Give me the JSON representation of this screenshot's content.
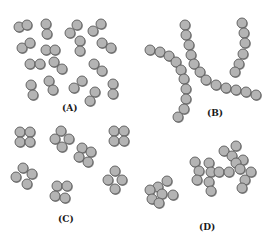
{
  "figure": {
    "panels": [
      {
        "id": "A",
        "label": "(A)",
        "arrangement": "diplococci"
      },
      {
        "id": "B",
        "label": "(B)",
        "arrangement": "streptococci"
      },
      {
        "id": "C",
        "label": "(C)",
        "arrangement": "tetrads"
      },
      {
        "id": "D",
        "label": "(D)",
        "arrangement": "staphylococci"
      }
    ],
    "colors": {
      "cell_fill": "#b4b4b4",
      "cell_outline": "#5a5a5a",
      "background": "#ffffff"
    }
  }
}
